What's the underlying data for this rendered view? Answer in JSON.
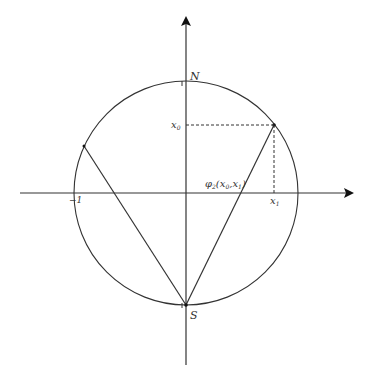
{
  "diagram": {
    "type": "stereographic-projection",
    "labels": {
      "north": "N",
      "south": "S",
      "x0": "x",
      "x0_sub": "0",
      "x1": "x",
      "x1_sub": "1",
      "minus_one": "−1",
      "one": "1",
      "projection_phi": "φ",
      "projection_sub": "2",
      "projection_args": "(x",
      "projection_args_sub0": "0",
      "projection_args_mid": ",x",
      "projection_args_sub1": "1",
      "projection_args_end": ")"
    },
    "colors": {
      "stroke": "#333333",
      "background": "#ffffff"
    }
  }
}
